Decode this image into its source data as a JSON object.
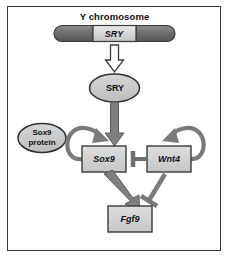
{
  "figure": {
    "title": "Y chromosome",
    "background_color": "#ffffff",
    "frame_color": "#3a3a3a"
  },
  "palette": {
    "chromosome_arm_fill": "#6d6d6d",
    "chromosome_gene_fill": "#d9d9d9",
    "oval_fill": "#c9c9c9",
    "box_fill": "#d4d4d4",
    "outline_dark": "#2f2f2f",
    "arrow_gray": "#7a7a7a",
    "arrow_white": "#ffffff",
    "text_color": "#111111"
  },
  "chromosome": {
    "name": "y-chromosome-bar",
    "caption": "Y chromosome",
    "segments": [
      {
        "label": "",
        "kind": "arm"
      },
      {
        "label": "SRY",
        "kind": "gene"
      },
      {
        "label": "",
        "kind": "arm"
      }
    ]
  },
  "nodes": [
    {
      "id": "sry-protein",
      "label": "SRY",
      "shape": "ellipse"
    },
    {
      "id": "sox9-protein",
      "label_line1": "Sox9",
      "label_line2": "protein",
      "shape": "ellipse"
    },
    {
      "id": "sox9-gene",
      "label": "Sox9",
      "shape": "box"
    },
    {
      "id": "wnt4-gene",
      "label": "Wnt4",
      "shape": "box"
    },
    {
      "id": "fgf9-gene",
      "label": "Fgf9",
      "shape": "box"
    }
  ],
  "edges": [
    {
      "id": "chromosome-to-sry",
      "from": "y-chromosome-bar",
      "to": "sry-protein",
      "kind": "activation",
      "style": "hollow-block-arrow"
    },
    {
      "id": "sry-to-sox9",
      "from": "sry-protein",
      "to": "sox9-gene",
      "kind": "activation",
      "style": "gray-block-arrow"
    },
    {
      "id": "sox9-self-loop",
      "from": "sox9-gene",
      "to": "sox9-gene",
      "kind": "activation",
      "style": "curved-gray-arrow"
    },
    {
      "id": "wnt4-self-loop",
      "from": "wnt4-gene",
      "to": "wnt4-gene",
      "kind": "activation",
      "style": "curved-gray-arrow"
    },
    {
      "id": "wnt4-inhibits-sox9",
      "from": "wnt4-gene",
      "to": "sox9-gene",
      "kind": "inhibition",
      "style": "t-bar"
    },
    {
      "id": "sox9-activates-fgf9",
      "from": "sox9-gene",
      "to": "fgf9-gene",
      "kind": "activation",
      "style": "gray-block-arrow"
    },
    {
      "id": "wnt4-inhibits-fgf9",
      "from": "wnt4-gene",
      "to": "fgf9-gene",
      "kind": "inhibition",
      "style": "t-bar"
    }
  ],
  "labels": {
    "sry_gene": "SRY",
    "sry_protein": "SRY",
    "sox9_protein_line1": "Sox9",
    "sox9_protein_line2": "protein",
    "sox9_gene": "Sox9",
    "wnt4_gene": "Wnt4",
    "fgf9_gene": "Fgf9"
  }
}
